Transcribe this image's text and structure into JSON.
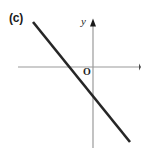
{
  "figure": {
    "panel_label": "(c)",
    "background_color": "#ffffff",
    "width": 145,
    "height": 153
  },
  "labels": {
    "y_axis": "y",
    "origin": "O"
  },
  "chart_data": {
    "type": "line",
    "title": "(c)",
    "xlabel": "",
    "ylabel": "y",
    "grid": false,
    "legend": null,
    "axes": {
      "x_axis": {
        "label": "",
        "orientation": "horizontal",
        "color": "#9a9a9a",
        "arrow_at": "right",
        "pixel_y": 67,
        "pixel_x_start": 18,
        "pixel_x_end": 140
      },
      "y_axis": {
        "label": "y",
        "orientation": "vertical",
        "color": "#9a9a9a",
        "arrow_at": "top",
        "pixel_x": 93,
        "pixel_y_start": 20,
        "pixel_y_end": 148
      },
      "origin": {
        "label": "O",
        "pixel_x": 93,
        "pixel_y": 67
      }
    },
    "series": [
      {
        "name": "line",
        "color": "#262626",
        "stroke_width": 2.6,
        "slope_sign": "negative",
        "x_intercept_pixel": 74,
        "y_intercept_pixel": 97,
        "endpoints_pixel": [
          {
            "x": 33,
            "y": 22
          },
          {
            "x": 130,
            "y": 142
          }
        ]
      }
    ]
  }
}
